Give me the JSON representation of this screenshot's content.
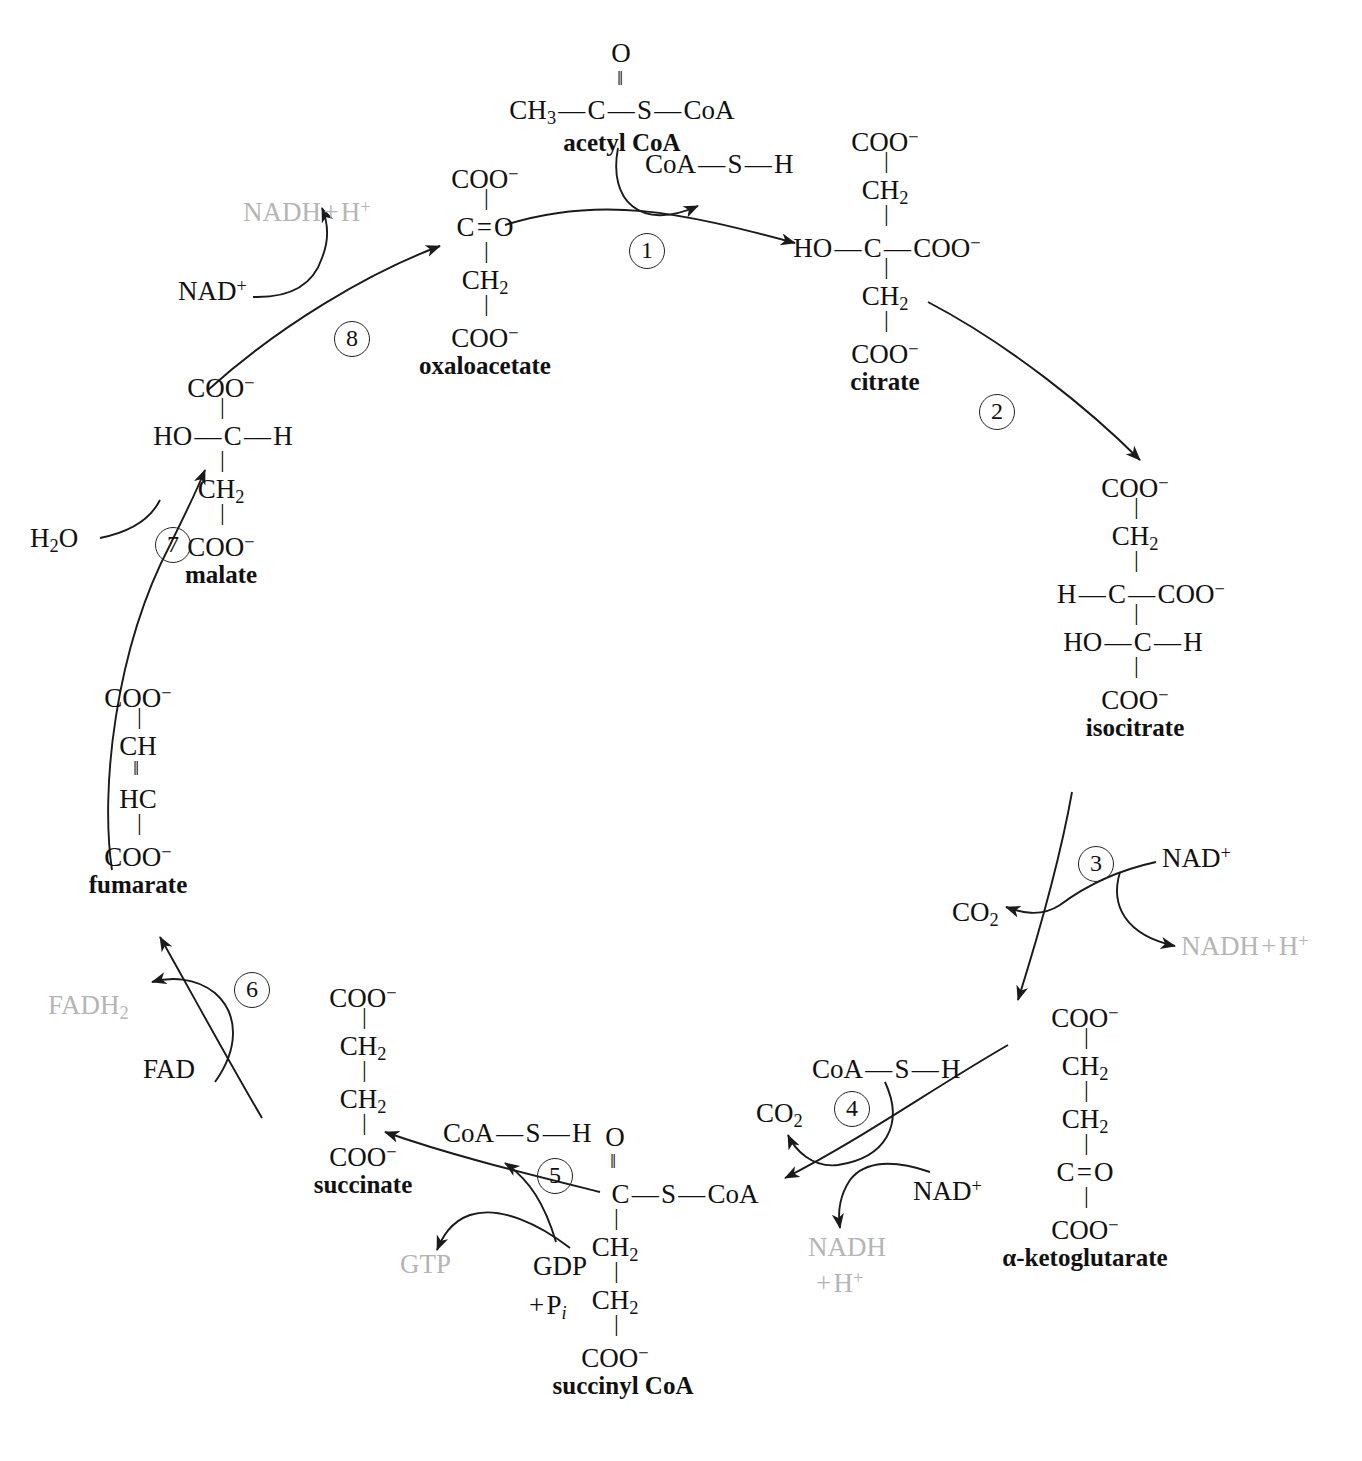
{
  "diagram": {
    "ink_color": "#1a1a1a",
    "muted_color": "#b5b5b5"
  },
  "molecules": {
    "acetyl_coa": {
      "name": "acetyl CoA",
      "top_atom": "O",
      "chain": "CH3 — C — S — CoA",
      "parts": {
        "ch3": "CH",
        "ch3_sub": "3",
        "c": "C",
        "s": "S",
        "coa": "CoA",
        "dash": "—"
      }
    },
    "oxaloacetate": {
      "name": "oxaloacetate",
      "rows": [
        "COO⁻",
        "C = O",
        "CH2",
        "COO⁻"
      ]
    },
    "citrate": {
      "name": "citrate",
      "rows": [
        "COO⁻",
        "CH2",
        "HO — C — COO⁻",
        "CH2",
        "COO⁻"
      ]
    },
    "isocitrate": {
      "name": "isocitrate",
      "rows": [
        "COO⁻",
        "CH2",
        "H — C — COO⁻",
        "HO — C — H",
        "COO⁻"
      ]
    },
    "alpha_ketoglutarate": {
      "name": "α-ketoglutarate",
      "rows": [
        "COO⁻",
        "CH2",
        "CH2",
        "C = O",
        "COO⁻"
      ]
    },
    "succinyl_coa": {
      "name": "succinyl CoA",
      "rows": [
        "O",
        "C — S — CoA",
        "CH2",
        "CH2",
        "COO⁻"
      ]
    },
    "succinate": {
      "name": "succinate",
      "rows": [
        "COO⁻",
        "CH2",
        "CH2",
        "COO⁻"
      ]
    },
    "fumarate": {
      "name": "fumarate",
      "rows": [
        "COO⁻",
        "CH",
        "HC",
        "COO⁻"
      ]
    },
    "malate": {
      "name": "malate",
      "rows": [
        "COO⁻",
        "HO — C — H",
        "CH2",
        "COO⁻"
      ]
    }
  },
  "steps": [
    {
      "num": "1",
      "label": "1"
    },
    {
      "num": "2",
      "label": "2"
    },
    {
      "num": "3",
      "label": "3"
    },
    {
      "num": "4",
      "label": "4"
    },
    {
      "num": "5",
      "label": "5"
    },
    {
      "num": "6",
      "label": "6"
    },
    {
      "num": "7",
      "label": "7"
    },
    {
      "num": "8",
      "label": "8"
    }
  ],
  "cofactors": {
    "coa_sh_step1": "CoA — S — H",
    "coa_sh_step4": "CoA — S — H",
    "coa_sh_step5": "CoA — S — H",
    "nad_plus_step3": "NAD+",
    "nad_plus_step4": "NAD+",
    "nad_plus_step8": "NAD+",
    "nadh_step3": "NADH + H+",
    "nadh_step4_line1": "NADH",
    "nadh_step4_line2": "+ H+",
    "nadh_step8": "NADH + H+",
    "co2_step3": "CO2",
    "co2_step4": "CO2",
    "fad": "FAD",
    "fadh2": "FADH2",
    "gdp": "GDP",
    "pi": "+ Pi",
    "gtp": "GTP",
    "water": "H2O"
  },
  "atom_text": {
    "COO": "COO",
    "minus": "−",
    "plus": "+",
    "C": "C",
    "H": "H",
    "O": "O",
    "HO": "HO",
    "HC": "HC",
    "CH": "CH",
    "S": "S",
    "CoA": "CoA",
    "dash": "—",
    "double_eq": "=",
    "two": "2",
    "three": "3"
  }
}
